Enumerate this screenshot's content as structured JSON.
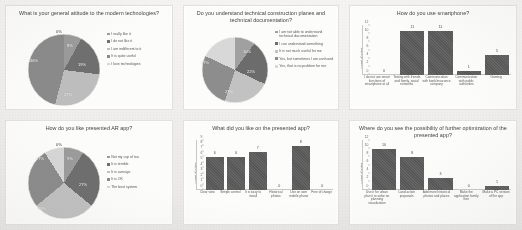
{
  "slide": {
    "background_color": "#f2f1ef",
    "panel_color": "#fcfcfb",
    "bar_color": "#5b5b5b"
  },
  "chart_data": [
    {
      "id": "attitude-to-modern-technologies",
      "type": "pie",
      "title": "What is your general  attitude to the modern technologies?",
      "categories": [
        "I really like it",
        "I do not like it",
        "I am indifferent to it",
        "It is quite useful",
        "I love technologies"
      ],
      "values": [
        8,
        19,
        27,
        46,
        0
      ],
      "labels": [
        "8%",
        "19%",
        "27%",
        "46%",
        "0%"
      ],
      "colors": [
        "#9a9a9a",
        "#6f6f6f",
        "#bdbdbd",
        "#8a8a8a",
        "#d5d5d5"
      ],
      "legend_position": "right"
    },
    {
      "id": "understand-technical-documentation",
      "type": "pie",
      "title": "Do you understand technical construction planes and technical documentation?",
      "categories": [
        "I am not able to understand technical documentation",
        "I can understand something",
        "It is not much useful for me",
        "Yes, but sometimes I am confused",
        "Yes, that is no problem for me"
      ],
      "values": [
        10,
        22,
        23,
        27,
        18
      ],
      "labels": [
        "10%",
        "22%",
        "23%",
        "27%",
        "18%"
      ],
      "colors": [
        "#a0a0a0",
        "#6c6c6c",
        "#c2c2c2",
        "#8d8d8d",
        "#d8d8d8"
      ],
      "legend_position": "right"
    },
    {
      "id": "how-do-you-use-smartphone",
      "type": "bar",
      "title": "How do you use smartphone?",
      "ylabel": "count of votes",
      "ylim": [
        0,
        12
      ],
      "yticks": [
        "0",
        "2",
        "4",
        "6",
        "8",
        "10",
        "12"
      ],
      "categories": [
        "I do not use smart functions of smartphone at all",
        "Texting with friends and family, social networks",
        "Communication with bank/insurance company",
        "Communication with public authorities",
        "Gaming"
      ],
      "values": [
        0,
        11,
        11,
        1,
        5
      ],
      "value_labels": [
        "0",
        "11",
        "11",
        "1",
        "5"
      ]
    },
    {
      "id": "how-do-you-like-presented-ar-app",
      "type": "pie",
      "title": "How do you like presented AR app?",
      "categories": [
        "Not my cup of tea",
        "It is terrible",
        "It is average",
        "It is OK",
        "The best system"
      ],
      "values": [
        9,
        27,
        28,
        27,
        9
      ],
      "labels": [
        "9%",
        "27%",
        "28%",
        "27%",
        "0%"
      ],
      "colors": [
        "#9b9b9b",
        "#6e6e6e",
        "#c0c0c0",
        "#8b8b8b",
        "#d6d6d6"
      ],
      "legend_position": "right"
    },
    {
      "id": "what-did-you-like-on-presented-app",
      "type": "bar",
      "title": "What did you like on the presented app?",
      "ylabel": "count of votes",
      "ylim": [
        0,
        9
      ],
      "yticks": [
        "0",
        "1",
        "2",
        "3",
        "4",
        "5",
        "6",
        "7",
        "8",
        "9"
      ],
      "categories": [
        "Clear view",
        "Simple control",
        "It is easy to install",
        "Historical photos",
        "Use on own mobile phone",
        "Free of charge"
      ],
      "values": [
        6,
        6,
        7,
        0,
        8,
        0
      ],
      "value_labels": [
        "6",
        "6",
        "7",
        "0",
        "8",
        "0"
      ]
    },
    {
      "id": "possibility-of-further-optimization",
      "type": "bar",
      "title": "Where do you see the possibility of further optimization of the presented app?",
      "ylabel": "count of votes",
      "ylim": [
        0,
        12
      ],
      "yticks": [
        "0",
        "2",
        "4",
        "6",
        "8",
        "10",
        "12"
      ],
      "categories": [
        "Use it for urban plan it to solve on planning visualization",
        "Land action proposals",
        "Add more historical photos and places",
        "Make the application family free",
        "Make a PC version of the app"
      ],
      "values": [
        10,
        8,
        3,
        0,
        1
      ],
      "value_labels": [
        "10",
        "8",
        "3",
        "0",
        "1"
      ]
    }
  ]
}
